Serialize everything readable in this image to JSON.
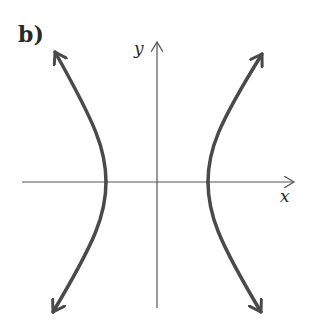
{
  "figure": {
    "part_label": "b)",
    "x_axis_label": "x",
    "y_axis_label": "y",
    "colors": {
      "axes": "#555555",
      "curve": "#4a4a4a",
      "background": "#ffffff",
      "text": "#2a2a2a"
    }
  }
}
